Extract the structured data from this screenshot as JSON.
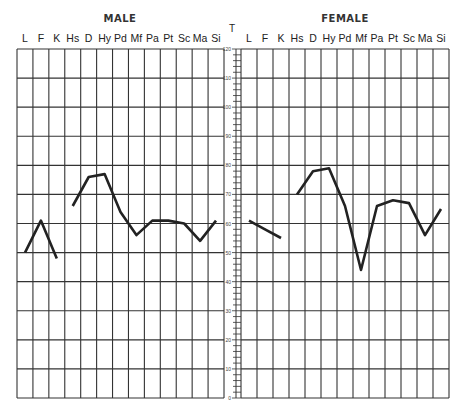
{
  "chart_data": [
    {
      "type": "line",
      "title": "MALE",
      "categories": [
        "L",
        "F",
        "K",
        "Hs",
        "D",
        "Hy",
        "Pd",
        "Mf",
        "Pa",
        "Pt",
        "Sc",
        "Ma",
        "Si"
      ],
      "segments": [
        {
          "categories": [
            "L",
            "F",
            "K"
          ],
          "values": [
            50,
            61,
            48
          ]
        },
        {
          "categories": [
            "Hs",
            "D",
            "Hy",
            "Pd",
            "Mf",
            "Pa",
            "Pt",
            "Sc",
            "Ma",
            "Si"
          ],
          "values": [
            66,
            76,
            77,
            64,
            56,
            61,
            61,
            60,
            54,
            61
          ]
        }
      ],
      "values": [
        50,
        61,
        48,
        66,
        76,
        77,
        64,
        56,
        61,
        61,
        60,
        54,
        61
      ],
      "xlabel": "",
      "ylabel": "T",
      "ylim": [
        0,
        120
      ],
      "grid": true
    },
    {
      "type": "line",
      "title": "FEMALE",
      "categories": [
        "L",
        "F",
        "K",
        "Hs",
        "D",
        "Hy",
        "Pd",
        "Mf",
        "Pa",
        "Pt",
        "Sc",
        "Ma",
        "Si"
      ],
      "segments": [
        {
          "categories": [
            "L",
            "F",
            "K"
          ],
          "values": [
            61,
            58,
            55
          ]
        },
        {
          "categories": [
            "Hs",
            "D",
            "Hy",
            "Pd",
            "Mf",
            "Pa",
            "Pt",
            "Sc",
            "Ma",
            "Si"
          ],
          "values": [
            70,
            78,
            79,
            66,
            44,
            66,
            68,
            67,
            56,
            65
          ]
        }
      ],
      "values": [
        61,
        58,
        55,
        70,
        78,
        79,
        66,
        44,
        66,
        68,
        67,
        56,
        65
      ],
      "xlabel": "",
      "ylabel": "T",
      "ylim": [
        0,
        120
      ],
      "grid": true
    }
  ],
  "axis": {
    "label": "T",
    "major_ticks": [
      "0",
      "10",
      "20",
      "30",
      "40",
      "50",
      "60",
      "70",
      "80",
      "90",
      "100",
      "110",
      "120"
    ]
  },
  "panels": {
    "male_title": "MALE",
    "female_title": "FEMALE"
  },
  "colors": {
    "line": "#222222",
    "grid": "#333333"
  }
}
